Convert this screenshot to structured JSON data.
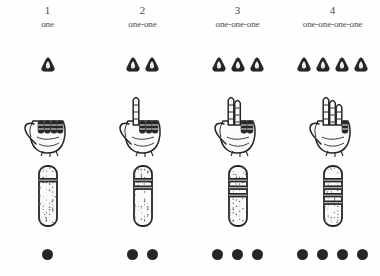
{
  "figure": {
    "background_color": "#fefefe",
    "ink_color": "#262626",
    "text_color": "#4a4a4a"
  },
  "columns": [
    {
      "numeral": "1",
      "word": "one",
      "pebble_count": 1,
      "fingers_extended": 0,
      "hand_label": "closed-fist",
      "stick_notches": 1,
      "dot_count": 1
    },
    {
      "numeral": "2",
      "word": "one-one",
      "pebble_count": 2,
      "fingers_extended": 1,
      "hand_label": "one-finger-raised",
      "stick_notches": 2,
      "dot_count": 2
    },
    {
      "numeral": "3",
      "word": "one-one-one",
      "pebble_count": 3,
      "fingers_extended": 2,
      "hand_label": "two-fingers-raised",
      "stick_notches": 3,
      "dot_count": 3
    },
    {
      "numeral": "4",
      "word": "one-one-one-one",
      "pebble_count": 4,
      "fingers_extended": 3,
      "hand_label": "three-fingers-raised",
      "stick_notches": 4,
      "dot_count": 4
    }
  ],
  "rows": [
    {
      "id": "numerals",
      "label": "numeral-and-word-header"
    },
    {
      "id": "pebbles",
      "label": "pebble-tokens"
    },
    {
      "id": "hands",
      "label": "hand-gestures"
    },
    {
      "id": "sticks",
      "label": "notched-tally-sticks"
    },
    {
      "id": "dots",
      "label": "filled-dots"
    }
  ]
}
